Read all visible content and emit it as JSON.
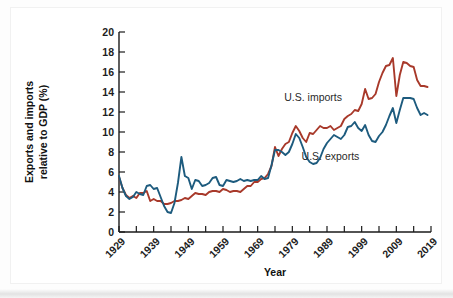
{
  "figure": {
    "background_color": "#fdfdfd",
    "card_color": "#ffffff"
  },
  "chart_data": {
    "type": "line",
    "title": "",
    "subtitle": "",
    "xlabel": "Year",
    "ylabel": "Exports and imports relative to GDP (%)",
    "ylabel_line1": "Exports and imports",
    "ylabel_line2": "relative to GDP (%)",
    "xlim": [
      1929,
      2019
    ],
    "ylim": [
      0,
      20
    ],
    "y_ticks": [
      0,
      2,
      4,
      6,
      8,
      10,
      12,
      14,
      16,
      18,
      20
    ],
    "y_tick_labels": [
      "0",
      "2",
      "4",
      "6",
      "8",
      "10",
      "12",
      "14",
      "16",
      "18",
      "20"
    ],
    "x_ticks_major": [
      1929,
      1939,
      1949,
      1959,
      1969,
      1979,
      1989,
      1999,
      2009,
      2019
    ],
    "x_tick_labels": [
      "1929",
      "1939",
      "1949",
      "1959",
      "1969",
      "1979",
      "1989",
      "1999",
      "2009",
      "2019"
    ],
    "x_ticks_minor_step": 5,
    "grid": false,
    "legend_position": "inline-annotations",
    "series": [
      {
        "name": "U.S. imports",
        "color": "#A8392A",
        "label_x": 1985,
        "label_y": 13.1,
        "x": [
          1929,
          1930,
          1931,
          1932,
          1933,
          1934,
          1935,
          1936,
          1937,
          1938,
          1939,
          1940,
          1941,
          1942,
          1943,
          1944,
          1945,
          1946,
          1947,
          1948,
          1949,
          1950,
          1951,
          1952,
          1953,
          1954,
          1955,
          1956,
          1957,
          1958,
          1959,
          1960,
          1961,
          1962,
          1963,
          1964,
          1965,
          1966,
          1967,
          1968,
          1969,
          1970,
          1971,
          1972,
          1973,
          1974,
          1975,
          1976,
          1977,
          1978,
          1979,
          1980,
          1981,
          1982,
          1983,
          1984,
          1985,
          1986,
          1987,
          1988,
          1989,
          1990,
          1991,
          1992,
          1993,
          1994,
          1995,
          1996,
          1997,
          1998,
          1999,
          2000,
          2001,
          2002,
          2003,
          2004,
          2005,
          2006,
          2007,
          2008,
          2009,
          2010,
          2011,
          2012,
          2013,
          2014,
          2015,
          2016,
          2017,
          2018
        ],
        "y": [
          5.5,
          4.4,
          3.7,
          3.4,
          3.6,
          3.4,
          3.9,
          3.9,
          4.1,
          3.1,
          3.3,
          3.1,
          3.1,
          2.8,
          2.8,
          2.9,
          3.1,
          3.1,
          3.2,
          3.4,
          3.3,
          3.6,
          3.9,
          3.8,
          3.8,
          3.7,
          4.0,
          4.1,
          4.1,
          4.0,
          4.3,
          4.2,
          4.0,
          4.1,
          4.1,
          4.0,
          4.3,
          4.6,
          4.6,
          5.0,
          5.0,
          5.3,
          5.4,
          5.8,
          6.6,
          8.5,
          7.6,
          8.3,
          8.8,
          9.0,
          9.9,
          10.6,
          10.1,
          9.4,
          9.0,
          9.9,
          9.8,
          10.2,
          10.6,
          10.4,
          10.4,
          10.6,
          10.2,
          10.4,
          10.6,
          11.3,
          11.6,
          11.8,
          12.2,
          12.1,
          12.8,
          14.3,
          13.3,
          13.4,
          13.8,
          15.0,
          15.9,
          16.6,
          16.7,
          17.4,
          13.6,
          15.7,
          17.0,
          16.9,
          16.6,
          16.5,
          15.2,
          14.6,
          14.6,
          14.5
        ]
      },
      {
        "name": "U.S. exports",
        "color": "#1D5B7E",
        "label_x": 1990,
        "label_y": 7.2,
        "x": [
          1929,
          1930,
          1931,
          1932,
          1933,
          1934,
          1935,
          1936,
          1937,
          1938,
          1939,
          1940,
          1941,
          1942,
          1943,
          1944,
          1945,
          1946,
          1947,
          1948,
          1949,
          1950,
          1951,
          1952,
          1953,
          1954,
          1955,
          1956,
          1957,
          1958,
          1959,
          1960,
          1961,
          1962,
          1963,
          1964,
          1965,
          1966,
          1967,
          1968,
          1969,
          1970,
          1971,
          1972,
          1973,
          1974,
          1975,
          1976,
          1977,
          1978,
          1979,
          1980,
          1981,
          1982,
          1983,
          1984,
          1985,
          1986,
          1987,
          1988,
          1989,
          1990,
          1991,
          1992,
          1993,
          1994,
          1995,
          1996,
          1997,
          1998,
          1999,
          2000,
          2001,
          2002,
          2003,
          2004,
          2005,
          2006,
          2007,
          2008,
          2009,
          2010,
          2011,
          2012,
          2013,
          2014,
          2015,
          2016,
          2017,
          2018
        ],
        "y": [
          5.6,
          4.4,
          3.6,
          3.3,
          3.5,
          4.0,
          3.8,
          3.7,
          4.6,
          4.7,
          4.3,
          4.4,
          3.5,
          2.6,
          2.0,
          1.9,
          2.9,
          4.9,
          7.5,
          5.6,
          5.4,
          4.3,
          5.2,
          5.1,
          4.6,
          4.7,
          4.9,
          5.4,
          5.5,
          4.7,
          4.6,
          5.2,
          5.1,
          5.0,
          5.1,
          5.3,
          5.1,
          5.2,
          5.1,
          5.2,
          5.2,
          5.6,
          5.3,
          5.4,
          6.7,
          8.2,
          8.2,
          8.0,
          7.7,
          8.0,
          8.8,
          9.8,
          9.4,
          8.5,
          7.5,
          7.0,
          6.8,
          6.9,
          7.4,
          8.3,
          8.9,
          9.3,
          9.7,
          9.5,
          9.3,
          9.7,
          10.5,
          10.6,
          11.0,
          10.4,
          10.1,
          10.7,
          9.7,
          9.1,
          9.0,
          9.6,
          10.0,
          10.7,
          11.6,
          12.4,
          10.9,
          12.2,
          13.4,
          13.4,
          13.4,
          13.3,
          12.4,
          11.7,
          11.9,
          11.7
        ]
      }
    ]
  }
}
